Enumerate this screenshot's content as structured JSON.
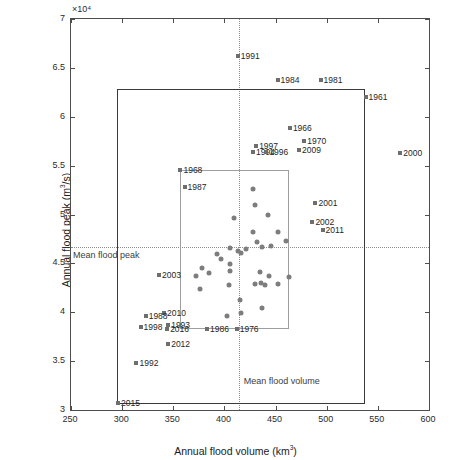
{
  "chart_data": {
    "type": "scatter",
    "title": "",
    "xlabel": "Annual flood volume (km3)",
    "ylabel": "Annual flood peak (m3/s)",
    "y_exponent": "×10⁴",
    "xlim": [
      250,
      600
    ],
    "ylim": [
      30000,
      70000
    ],
    "xticks": [
      250,
      300,
      350,
      400,
      450,
      500,
      550,
      600
    ],
    "yticks": [
      3,
      3.5,
      4,
      4.5,
      5,
      5.5,
      6,
      6.5,
      7
    ],
    "ytick_labels": [
      "3",
      "3.5",
      "4",
      "4.5",
      "5",
      "5.5",
      "6",
      "6.5",
      "7"
    ],
    "xtick_labels": [
      "250",
      "300",
      "350",
      "400",
      "450",
      "500",
      "550",
      "600"
    ],
    "grid": false,
    "legend": "none",
    "marker_color": "#7d7d7d",
    "mean_flood_peak_label": "Mean flood peak",
    "mean_flood_volume_label": "Mean flood volume",
    "mean_flood_peak_value": 46700,
    "mean_flood_volume_value": 414,
    "outer_box": {
      "x0": 295,
      "x1": 537,
      "y0": 30600,
      "y1": 62800,
      "color": "#3a3a3a"
    },
    "inner_box": {
      "x0": 357,
      "x1": 463,
      "y0": 38300,
      "y1": 54600,
      "color": "#9e9e9e"
    },
    "labeled_points": [
      {
        "label": "1991",
        "x": 413,
        "y": 66200
      },
      {
        "label": "1984",
        "x": 452,
        "y": 63800
      },
      {
        "label": "1981",
        "x": 494,
        "y": 63800
      },
      {
        "label": "1961",
        "x": 538,
        "y": 62000
      },
      {
        "label": "1966",
        "x": 464,
        "y": 58900
      },
      {
        "label": "1970",
        "x": 478,
        "y": 57500
      },
      {
        "label": "2009",
        "x": 473,
        "y": 56600
      },
      {
        "label": "1997",
        "x": 431,
        "y": 57000
      },
      {
        "label": "1994",
        "x": 428,
        "y": 56400
      },
      {
        "label": "1996",
        "x": 441,
        "y": 56400
      },
      {
        "label": "2000",
        "x": 572,
        "y": 56300
      },
      {
        "label": "1987",
        "x": 361,
        "y": 52800
      },
      {
        "label": "1968",
        "x": 357,
        "y": 54600
      },
      {
        "label": "2001",
        "x": 489,
        "y": 51200
      },
      {
        "label": "2002",
        "x": 486,
        "y": 49200
      },
      {
        "label": "2011",
        "x": 496,
        "y": 48400
      },
      {
        "label": "2003",
        "x": 336,
        "y": 43800
      },
      {
        "label": "2010",
        "x": 341,
        "y": 39900
      },
      {
        "label": "1988",
        "x": 323,
        "y": 39600
      },
      {
        "label": "1998",
        "x": 318,
        "y": 38500
      },
      {
        "label": "1993",
        "x": 345,
        "y": 38700
      },
      {
        "label": "2016",
        "x": 344,
        "y": 38300
      },
      {
        "label": "1986",
        "x": 383,
        "y": 38300
      },
      {
        "label": "1976",
        "x": 412,
        "y": 38300
      },
      {
        "label": "2012",
        "x": 345,
        "y": 36800
      },
      {
        "label": "1992",
        "x": 314,
        "y": 34800
      },
      {
        "label": "2015",
        "x": 296,
        "y": 30700
      }
    ],
    "cluster_points": [
      {
        "x": 428,
        "y": 52600
      },
      {
        "x": 430,
        "y": 51000
      },
      {
        "x": 443,
        "y": 50000
      },
      {
        "x": 409,
        "y": 49600
      },
      {
        "x": 428,
        "y": 48200
      },
      {
        "x": 452,
        "y": 48200
      },
      {
        "x": 432,
        "y": 47200
      },
      {
        "x": 460,
        "y": 47300
      },
      {
        "x": 437,
        "y": 46700
      },
      {
        "x": 446,
        "y": 46800
      },
      {
        "x": 405,
        "y": 46600
      },
      {
        "x": 413,
        "y": 46300
      },
      {
        "x": 421,
        "y": 46500
      },
      {
        "x": 416,
        "y": 46100
      },
      {
        "x": 393,
        "y": 46000
      },
      {
        "x": 397,
        "y": 45400
      },
      {
        "x": 405,
        "y": 44900
      },
      {
        "x": 378,
        "y": 44500
      },
      {
        "x": 385,
        "y": 44000
      },
      {
        "x": 372,
        "y": 43700
      },
      {
        "x": 405,
        "y": 44200
      },
      {
        "x": 435,
        "y": 44100
      },
      {
        "x": 444,
        "y": 43700
      },
      {
        "x": 436,
        "y": 43000
      },
      {
        "x": 440,
        "y": 42800
      },
      {
        "x": 430,
        "y": 42900
      },
      {
        "x": 452,
        "y": 42900
      },
      {
        "x": 404,
        "y": 42800
      },
      {
        "x": 376,
        "y": 42400
      },
      {
        "x": 415,
        "y": 41300
      },
      {
        "x": 416,
        "y": 39900
      },
      {
        "x": 437,
        "y": 40400
      },
      {
        "x": 403,
        "y": 39600
      },
      {
        "x": 463,
        "y": 43600
      }
    ]
  }
}
